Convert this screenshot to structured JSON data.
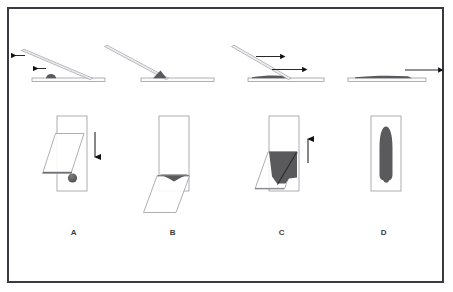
{
  "figure": {
    "panel_labels": [
      "A",
      "B",
      "C",
      "D"
    ],
    "border_color": "#3a3a40",
    "background_color": "#ffffff",
    "slide_outline_color": "#9a9aa0",
    "slide_fill_color": "#ffffff",
    "blood_color": "#5a5a5c",
    "arrow_color": "#111111",
    "label_color": "#3c3c40"
  },
  "panels": [
    {
      "label": "A",
      "caption_letter": "A",
      "side_view": {
        "base_slide": "horizontal glass slide",
        "spreader_slide": "angled spreader slide tilted about 30 degrees, raised at left",
        "blood": "single round drop of blood resting on base slide",
        "arrows": [
          {
            "name": "spreader-pullback-arrow",
            "direction": "left",
            "position": "upper"
          },
          {
            "name": "drop-approach-arrow",
            "direction": "left",
            "position": "lower"
          }
        ]
      },
      "top_view": {
        "base_slide": "vertical rectangle slide",
        "spreader_slide": "parallelogram overlapping slide, angled",
        "blood": "round drop of blood on slide surface",
        "arrows": [
          {
            "name": "spreader-backward-arrow",
            "direction": "down",
            "position": "right of slide"
          }
        ]
      }
    },
    {
      "label": "B",
      "caption_letter": "B",
      "side_view": {
        "base_slide": "horizontal glass slide",
        "spreader_slide": "angled spreader slide pulled back into the drop, contacting base slide",
        "blood": "blood drawn into the acute angle at the spreader edge",
        "arrows": []
      },
      "top_view": {
        "base_slide": "vertical rectangle slide",
        "spreader_slide": "parallelogram positioned lower, edge across slide",
        "blood": "blood spread as a thin wedge along the spreader contact edge",
        "arrows": []
      }
    },
    {
      "label": "C",
      "caption_letter": "C",
      "side_view": {
        "base_slide": "horizontal glass slide",
        "spreader_slide": "angled spreader slide advancing forward along the base slide",
        "blood": "blood film being drawn out behind the spreader edge",
        "arrows": [
          {
            "name": "spreader-push-arrow-upper",
            "direction": "right",
            "position": "upper"
          },
          {
            "name": "spreader-push-arrow-lower",
            "direction": "right",
            "position": "lower"
          }
        ]
      },
      "top_view": {
        "base_slide": "vertical rectangle slide",
        "spreader_slide": "parallelogram mid-slide",
        "blood": "dark blood film spread over the middle of the slide",
        "arrows": [
          {
            "name": "spread-direction-arrow",
            "direction": "up",
            "position": "right of slide"
          }
        ]
      }
    },
    {
      "label": "D",
      "caption_letter": "D",
      "side_view": {
        "base_slide": "horizontal glass slide with completed thin blood film",
        "spreader_slide": "removed",
        "blood": "finished flat smear layer on slide",
        "arrows": [
          {
            "name": "completion-arrow",
            "direction": "right",
            "position": "above slide"
          }
        ]
      },
      "top_view": {
        "base_slide": "vertical rectangle slide",
        "spreader_slide": "removed",
        "blood": "completed bullet-shaped smear with feathered edge",
        "arrows": []
      }
    }
  ]
}
